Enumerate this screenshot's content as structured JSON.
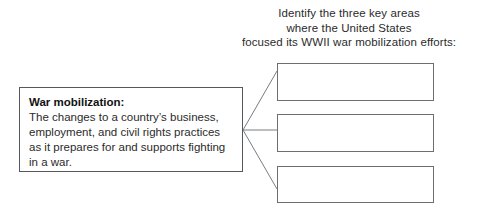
{
  "prompt": {
    "line1": "Identify the three key areas",
    "line2": "where the United States",
    "line3": "focused its WWII war mobilization efforts:"
  },
  "definition": {
    "term": "War mobilization:",
    "line1": "The changes to a country’s business,",
    "line2": "employment, and civil rights practices",
    "line3": "as it prepares for and supports fighting",
    "line4": "in a war."
  },
  "answers": [
    {
      "label": "",
      "placeholder": ""
    },
    {
      "label": "",
      "placeholder": ""
    },
    {
      "label": "",
      "placeholder": ""
    }
  ],
  "colors": {
    "page_background": "#ffffff",
    "text": "#2b2b2b",
    "definition_border": "#55585c",
    "answer_border": "#6b6e72",
    "connector": "#7a7d81"
  }
}
